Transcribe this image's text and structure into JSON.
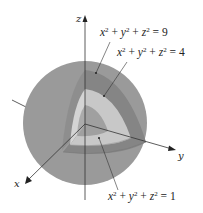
{
  "diagram": {
    "axes": {
      "x_label": "x",
      "y_label": "y",
      "z_label": "z"
    },
    "surfaces": [
      {
        "equation_lhs": "x² + y² + z²",
        "rhs": "9",
        "label": "x² + y² + z² = 9",
        "radius": 3
      },
      {
        "equation_lhs": "x² + y² + z²",
        "rhs": "4",
        "label": "x² + y² + z² = 4",
        "radius": 2
      },
      {
        "equation_lhs": "x² + y² + z²",
        "rhs": "1",
        "label": "x² + y² + z² = 1",
        "radius": 1
      }
    ],
    "colors": {
      "outer_sphere": "#9a9a9a",
      "outer_shell_cut": "#858585",
      "middle_shell_cut": "#c8c8c8",
      "inner_sphere_cut": "#a0a0a0",
      "axis": "#333333",
      "background": "#ffffff"
    }
  }
}
